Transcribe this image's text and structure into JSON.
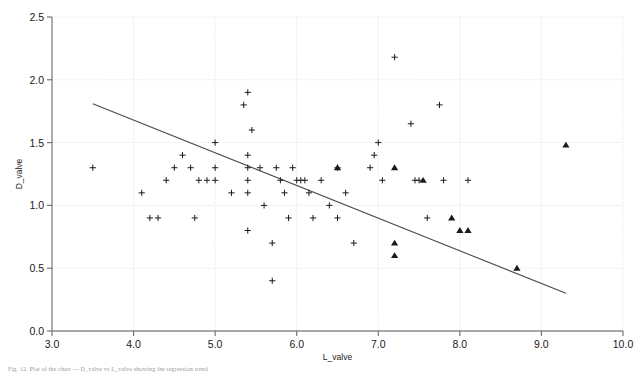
{
  "figure": {
    "caption": "Fig. 12. Plot of the chart — D_valve vs L_valve showing the regression trend",
    "background_color": "#ffffff"
  },
  "chart_data": {
    "type": "scatter",
    "title": "",
    "xlabel": "L_valve",
    "ylabel": "D_valve",
    "xlim": [
      3.0,
      10.0
    ],
    "ylim": [
      0.0,
      2.5
    ],
    "xticks": [
      "3.0",
      "4.0",
      "5.0",
      "6.0",
      "7.0",
      "8.0",
      "9.0",
      "10.0"
    ],
    "yticks": [
      "0.0",
      "0.5",
      "1.0",
      "1.5",
      "2.0",
      "2.5"
    ],
    "xtick_values": [
      3.0,
      4.0,
      5.0,
      6.0,
      7.0,
      8.0,
      9.0,
      10.0
    ],
    "ytick_values": [
      0.0,
      0.5,
      1.0,
      1.5,
      2.0,
      2.5
    ],
    "grid": true,
    "grid_color": "#d8d8d8",
    "grid_style": "dotted",
    "legend": null,
    "marker_color": "#1a1a1a",
    "line_color": "#4a4a4a",
    "series": [
      {
        "name": "plus-series",
        "marker": "plus",
        "points": [
          [
            3.5,
            1.3
          ],
          [
            4.1,
            1.1
          ],
          [
            4.2,
            0.9
          ],
          [
            4.3,
            0.9
          ],
          [
            4.4,
            1.2
          ],
          [
            4.5,
            1.3
          ],
          [
            4.6,
            1.4
          ],
          [
            4.7,
            1.3
          ],
          [
            4.75,
            0.9
          ],
          [
            4.8,
            1.2
          ],
          [
            4.9,
            1.2
          ],
          [
            5.0,
            1.5
          ],
          [
            5.0,
            1.3
          ],
          [
            5.0,
            1.2
          ],
          [
            5.2,
            1.1
          ],
          [
            5.35,
            1.8
          ],
          [
            5.4,
            1.9
          ],
          [
            5.4,
            1.4
          ],
          [
            5.4,
            1.3
          ],
          [
            5.4,
            1.2
          ],
          [
            5.4,
            1.1
          ],
          [
            5.4,
            0.8
          ],
          [
            5.45,
            1.6
          ],
          [
            5.55,
            1.3
          ],
          [
            5.6,
            1.0
          ],
          [
            5.7,
            0.7
          ],
          [
            5.7,
            0.4
          ],
          [
            5.75,
            1.3
          ],
          [
            5.8,
            1.2
          ],
          [
            5.85,
            1.1
          ],
          [
            5.9,
            0.9
          ],
          [
            5.95,
            1.3
          ],
          [
            6.0,
            1.2
          ],
          [
            6.05,
            1.2
          ],
          [
            6.1,
            1.2
          ],
          [
            6.15,
            1.1
          ],
          [
            6.2,
            0.9
          ],
          [
            6.3,
            1.2
          ],
          [
            6.4,
            1.0
          ],
          [
            6.5,
            1.3
          ],
          [
            6.5,
            0.9
          ],
          [
            6.6,
            1.1
          ],
          [
            6.7,
            0.7
          ],
          [
            6.9,
            1.3
          ],
          [
            6.95,
            1.4
          ],
          [
            7.0,
            1.5
          ],
          [
            7.05,
            1.2
          ],
          [
            7.2,
            2.18
          ],
          [
            7.4,
            1.65
          ],
          [
            7.45,
            1.2
          ],
          [
            7.5,
            1.2
          ],
          [
            7.6,
            0.9
          ],
          [
            7.75,
            1.8
          ],
          [
            7.8,
            1.2
          ],
          [
            8.1,
            1.2
          ]
        ]
      },
      {
        "name": "triangle-series",
        "marker": "triangle",
        "points": [
          [
            6.5,
            1.3
          ],
          [
            7.2,
            1.3
          ],
          [
            7.2,
            0.7
          ],
          [
            7.2,
            0.6
          ],
          [
            7.9,
            0.9
          ],
          [
            8.0,
            0.8
          ],
          [
            8.1,
            0.8
          ],
          [
            7.55,
            1.2
          ],
          [
            8.7,
            0.5
          ],
          [
            9.3,
            1.48
          ]
        ]
      }
    ],
    "trend_line": {
      "name": "regression-line",
      "x_start": 3.5,
      "y_start": 1.81,
      "x_end": 9.3,
      "y_end": 0.3,
      "color": "#4a4a4a"
    }
  }
}
